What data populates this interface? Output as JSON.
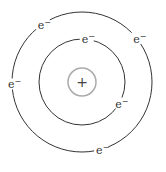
{
  "diagram": {
    "type": "bohr-atom-model",
    "nucleus": {
      "label": "+",
      "stroke": "#aaaaaa"
    },
    "shells": [
      {
        "name": "inner-shell",
        "radius": 43,
        "electrons": [
          {
            "label": "e",
            "charge": "−",
            "angle": -85
          },
          {
            "label": "e",
            "charge": "−",
            "angle": 30
          }
        ]
      },
      {
        "name": "outer-shell",
        "radius": 70,
        "electrons": [
          {
            "label": "e",
            "charge": "−",
            "angle": -125
          },
          {
            "label": "e",
            "charge": "−",
            "angle": -38
          },
          {
            "label": "e",
            "charge": "−",
            "angle": 178
          },
          {
            "label": "e",
            "charge": "−",
            "angle": 75
          }
        ]
      }
    ],
    "colors": {
      "orbit": "#333333",
      "nucleus": "#aaaaaa",
      "background": "#ffffff"
    }
  }
}
